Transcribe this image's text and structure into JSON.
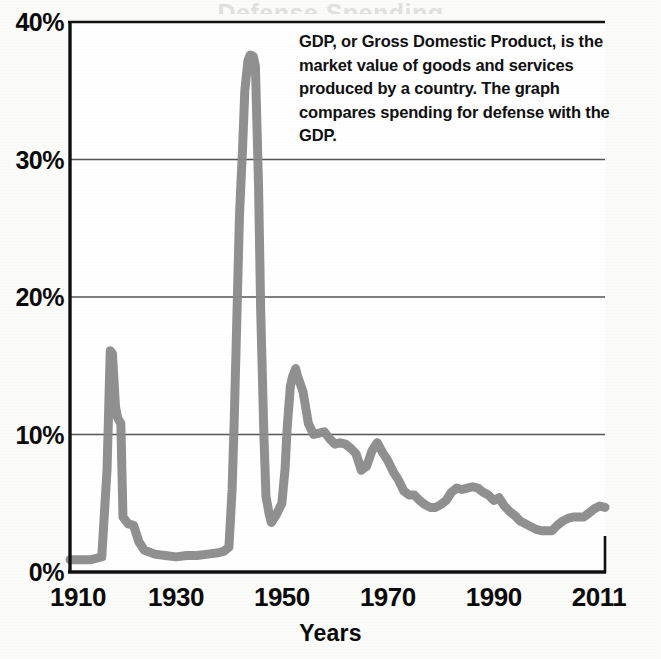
{
  "figure": {
    "background_color": "#fbfbfa",
    "cropped_title_sliver": "Defense Spending"
  },
  "annotation": {
    "text": "GDP, or Gross Domestic Product, is the market value of goods and services produced by a country. The graph compares spending for defense with the GDP."
  },
  "axis_title": {
    "x": "Years"
  },
  "chart_data": {
    "type": "line",
    "title": "",
    "subtitle": "",
    "xlabel": "Years",
    "ylabel": "",
    "xlim": [
      1910,
      2011
    ],
    "ylim": [
      0,
      40
    ],
    "grid": true,
    "grid_axis": "y",
    "legend": "none",
    "line_color": "#8a8a8a",
    "line_width_px": 9,
    "axis_color": "#111111",
    "gridline_color": "#555555",
    "x_ticks": [
      1910,
      1930,
      1950,
      1970,
      1990,
      2011
    ],
    "x_tick_labels": [
      "1910",
      "1930",
      "1950",
      "1970",
      "1990",
      "2011"
    ],
    "y_ticks": [
      0,
      10,
      20,
      30,
      40
    ],
    "y_tick_labels": [
      "0%",
      "10%",
      "20%",
      "30%",
      "40%"
    ],
    "series": [
      {
        "name": "Defense spending as percent of GDP",
        "x": [
          1910,
          1912,
          1914,
          1915,
          1916,
          1917,
          1917.6,
          1918,
          1918.6,
          1919,
          1919.6,
          1920,
          1921,
          1922,
          1923,
          1924,
          1926,
          1928,
          1930,
          1932,
          1934,
          1936,
          1938,
          1939,
          1940,
          1940.6,
          1941,
          1941.6,
          1942,
          1942.6,
          1943,
          1943.6,
          1944,
          1944.6,
          1945,
          1945.6,
          1946,
          1946.6,
          1947,
          1947.6,
          1948,
          1949,
          1950,
          1950.6,
          1951,
          1951.6,
          1952,
          1952.6,
          1953,
          1954,
          1955,
          1956,
          1957,
          1958,
          1959,
          1960,
          1961,
          1962,
          1963,
          1964,
          1965,
          1966,
          1967,
          1968,
          1969,
          1970,
          1971,
          1972,
          1973,
          1974,
          1975,
          1976,
          1977,
          1978,
          1979,
          1980,
          1981,
          1982,
          1983,
          1984,
          1985,
          1986,
          1987,
          1988,
          1989,
          1990,
          1991,
          1992,
          1993,
          1994,
          1995,
          1996,
          1997,
          1998,
          1999,
          2000,
          2001,
          2002,
          2003,
          2004,
          2005,
          2006,
          2007,
          2008,
          2009,
          2010,
          2011
        ],
        "y": [
          0.9,
          0.9,
          0.9,
          1.0,
          1.1,
          7.5,
          16.1,
          15.9,
          12.0,
          11.2,
          10.8,
          4.0,
          3.5,
          3.4,
          2.2,
          1.6,
          1.3,
          1.2,
          1.1,
          1.2,
          1.2,
          1.3,
          1.4,
          1.5,
          1.8,
          6.0,
          11.0,
          20.0,
          26.0,
          31.0,
          35.0,
          37.2,
          37.6,
          37.5,
          36.8,
          28.0,
          19.0,
          10.0,
          5.5,
          4.2,
          3.6,
          4.2,
          5.0,
          7.5,
          10.5,
          13.5,
          14.2,
          14.8,
          14.2,
          13.1,
          10.8,
          10.0,
          10.1,
          10.2,
          9.7,
          9.3,
          9.4,
          9.3,
          9.0,
          8.6,
          7.4,
          7.7,
          8.8,
          9.4,
          8.7,
          8.1,
          7.3,
          6.7,
          5.9,
          5.6,
          5.6,
          5.2,
          4.9,
          4.7,
          4.7,
          4.9,
          5.2,
          5.8,
          6.1,
          6.0,
          6.1,
          6.2,
          6.1,
          5.8,
          5.6,
          5.2,
          5.4,
          4.8,
          4.4,
          4.1,
          3.7,
          3.5,
          3.3,
          3.1,
          3.0,
          3.0,
          3.0,
          3.4,
          3.7,
          3.9,
          4.0,
          4.0,
          4.0,
          4.3,
          4.6,
          4.8,
          4.7
        ]
      }
    ]
  }
}
